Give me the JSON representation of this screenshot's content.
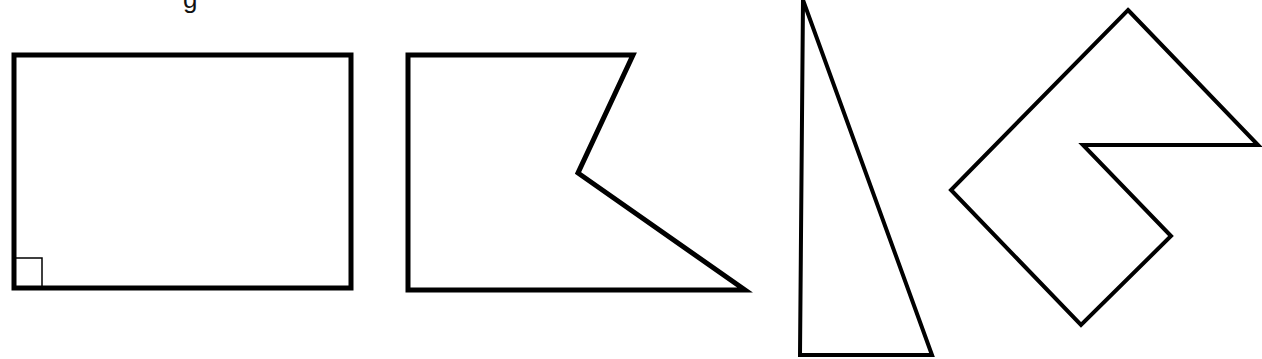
{
  "title_fragment": "g",
  "stroke_color": "#000000",
  "background": "#ffffff",
  "shapes": [
    {
      "name": "rectangle",
      "points": "14,55 351,55 351,288 14,288",
      "stroke_width": 5,
      "right_angle_marker": "14,258 42,258 42,288"
    },
    {
      "name": "pentagon",
      "points": "408,55 633,55 578,173 745,290 408,290",
      "stroke_width": 5
    },
    {
      "name": "right-triangle",
      "points": "803,0 800,355 932,355",
      "stroke_width": 4
    },
    {
      "name": "hexagon",
      "points": "1128,10 1258,145 1083,145 1171,236 1081,325 951,190",
      "stroke_width": 4
    }
  ]
}
